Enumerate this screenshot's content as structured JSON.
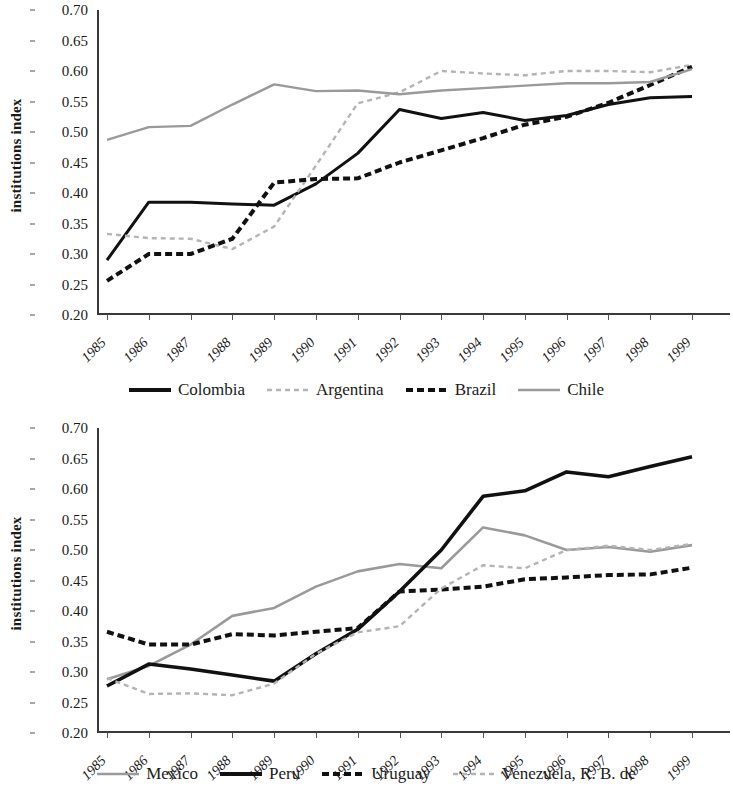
{
  "figure": {
    "panels": [
      {
        "id": "panel-top",
        "ylabel": "institutions index",
        "yticks": [
          "0.70",
          "0.65",
          "0.60",
          "0.55",
          "0.50",
          "0.45",
          "0.40",
          "0.35",
          "0.30",
          "0.25",
          "0.20"
        ],
        "xticks": [
          "1985",
          "1986",
          "1987",
          "1988",
          "1989",
          "1990",
          "1991",
          "1992",
          "1993",
          "1994",
          "1995",
          "1996",
          "1997",
          "1998",
          "1999"
        ],
        "legend": [
          {
            "label": "Colombia",
            "style": "solid-black",
            "color": "#111111"
          },
          {
            "label": "Argentina",
            "style": "dashed-gray",
            "color": "#b4b4b4"
          },
          {
            "label": "Brazil",
            "style": "dashed-black",
            "color": "#111111"
          },
          {
            "label": "Chile",
            "style": "solid-gray",
            "color": "#9a9a9a"
          }
        ]
      },
      {
        "id": "panel-bottom",
        "ylabel": "institutions index",
        "yticks": [
          "0.70",
          "0.65",
          "0.60",
          "0.55",
          "0.50",
          "0.45",
          "0.40",
          "0.35",
          "0.30",
          "0.25",
          "0.20"
        ],
        "xticks": [
          "1985",
          "1986",
          "1987",
          "1988",
          "1989",
          "1990",
          "1991",
          "1992",
          "1993",
          "1994",
          "1995",
          "1996",
          "1997",
          "1998",
          "1999"
        ],
        "legend": [
          {
            "label": "Mexico",
            "style": "solid-gray",
            "color": "#9a9a9a"
          },
          {
            "label": "Peru",
            "style": "solid-black",
            "color": "#111111"
          },
          {
            "label": "Uruguay",
            "style": "dashed-black",
            "color": "#111111"
          },
          {
            "label": "Venezuela, R. B. de",
            "style": "dashed-gray",
            "color": "#b4b4b4"
          }
        ]
      }
    ]
  },
  "chart_data": [
    {
      "type": "line",
      "title": "",
      "xlabel": "",
      "ylabel": "institutions index",
      "x": [
        1985,
        1986,
        1987,
        1988,
        1989,
        1990,
        1991,
        1992,
        1993,
        1994,
        1995,
        1996,
        1997,
        1998,
        1999
      ],
      "xlim": [
        1985,
        1999
      ],
      "ylim": [
        0.2,
        0.7
      ],
      "ytick_step": 0.05,
      "grid": false,
      "legend_position": "bottom",
      "series": [
        {
          "name": "Colombia",
          "style": "solid",
          "color": "#111111",
          "width": 3,
          "values": [
            0.29,
            0.385,
            0.385,
            0.382,
            0.38,
            0.415,
            0.465,
            0.537,
            0.522,
            0.532,
            0.519,
            0.527,
            0.545,
            0.556,
            0.558
          ]
        },
        {
          "name": "Argentina",
          "style": "dashed",
          "color": "#b4b4b4",
          "width": 2.4,
          "values": [
            0.333,
            0.326,
            0.325,
            0.308,
            0.345,
            0.445,
            0.547,
            0.565,
            0.6,
            0.596,
            0.593,
            0.6,
            0.6,
            0.598,
            0.61
          ]
        },
        {
          "name": "Brazil",
          "style": "dashed",
          "color": "#111111",
          "width": 4,
          "values": [
            0.256,
            0.3,
            0.3,
            0.325,
            0.417,
            0.423,
            0.424,
            0.45,
            0.47,
            0.49,
            0.512,
            0.525,
            0.548,
            0.577,
            0.607
          ]
        },
        {
          "name": "Chile",
          "style": "solid",
          "color": "#9a9a9a",
          "width": 2.4,
          "values": [
            0.487,
            0.508,
            0.51,
            0.545,
            0.578,
            0.567,
            0.568,
            0.562,
            0.568,
            0.572,
            0.576,
            0.58,
            0.58,
            0.582,
            0.603
          ]
        }
      ]
    },
    {
      "type": "line",
      "title": "",
      "xlabel": "",
      "ylabel": "institutions index",
      "x": [
        1985,
        1986,
        1987,
        1988,
        1989,
        1990,
        1991,
        1992,
        1993,
        1994,
        1995,
        1996,
        1997,
        1998,
        1999
      ],
      "xlim": [
        1985,
        1999
      ],
      "ylim": [
        0.2,
        0.7
      ],
      "ytick_step": 0.05,
      "grid": false,
      "legend_position": "bottom",
      "series": [
        {
          "name": "Mexico",
          "style": "solid",
          "color": "#9a9a9a",
          "width": 2.6,
          "values": [
            0.288,
            0.31,
            0.345,
            0.392,
            0.405,
            0.44,
            0.465,
            0.477,
            0.47,
            0.537,
            0.524,
            0.5,
            0.505,
            0.497,
            0.508
          ]
        },
        {
          "name": "Peru",
          "style": "solid",
          "color": "#111111",
          "width": 3.6,
          "values": [
            0.277,
            0.313,
            0.305,
            0.295,
            0.285,
            0.33,
            0.37,
            0.432,
            0.5,
            0.588,
            0.597,
            0.628,
            0.62,
            0.637,
            0.653
          ]
        },
        {
          "name": "Uruguay",
          "style": "dashed",
          "color": "#111111",
          "width": 4,
          "values": [
            0.366,
            0.345,
            0.345,
            0.362,
            0.36,
            0.366,
            0.372,
            0.432,
            0.435,
            0.44,
            0.452,
            0.455,
            0.459,
            0.46,
            0.471
          ]
        },
        {
          "name": "Venezuela, R. B. de",
          "style": "dashed",
          "color": "#b4b4b4",
          "width": 2.4,
          "values": [
            0.29,
            0.264,
            0.265,
            0.262,
            0.281,
            0.33,
            0.365,
            0.375,
            0.437,
            0.475,
            0.47,
            0.5,
            0.507,
            0.5,
            0.51
          ]
        }
      ]
    }
  ]
}
